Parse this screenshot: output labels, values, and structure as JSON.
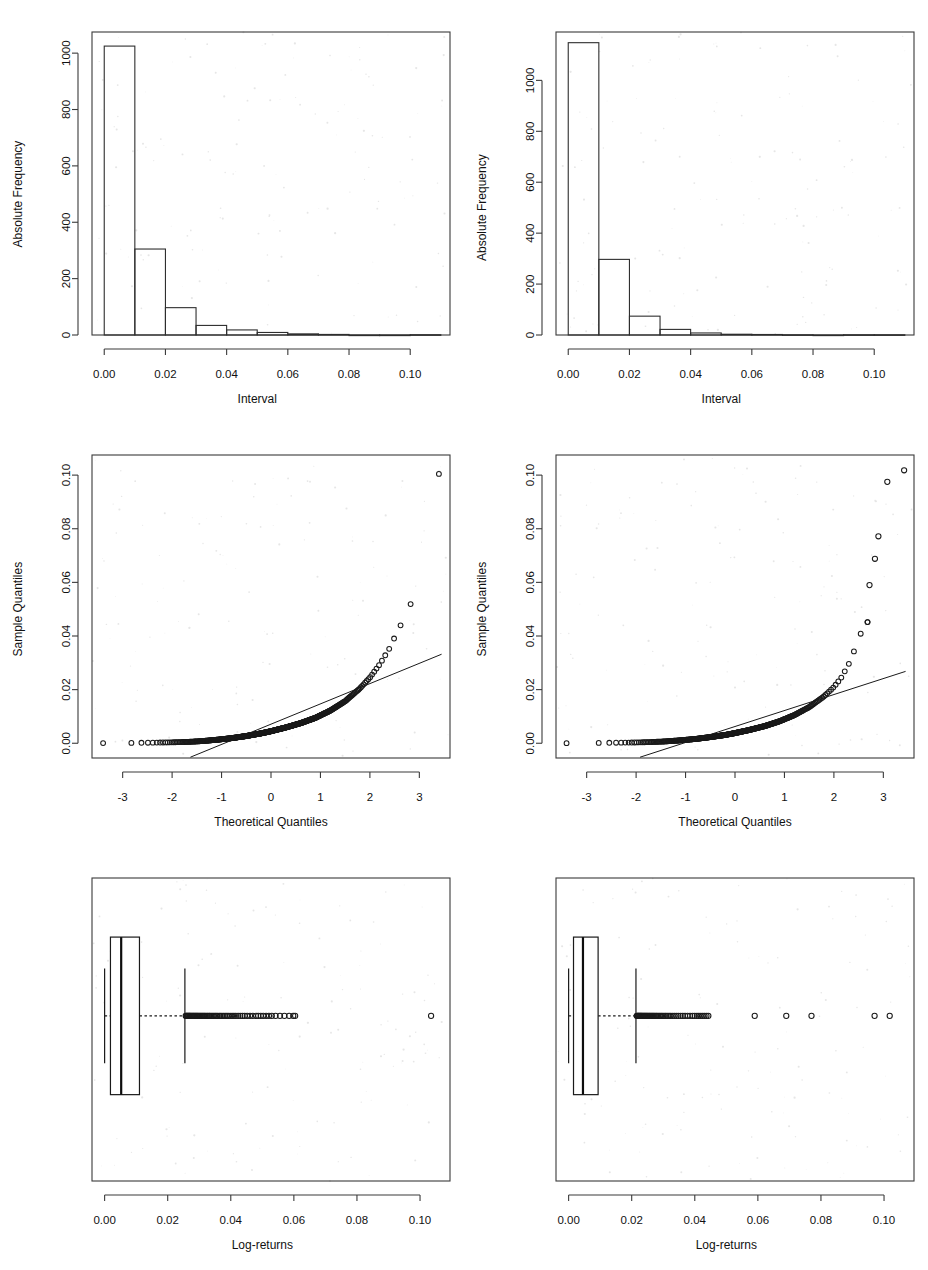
{
  "figure": {
    "width": 928,
    "height": 1270,
    "background": "#ffffff",
    "layout": "2 columns x 3 rows of R base-graphics panels",
    "ink_color": "#1a1a1a"
  },
  "chart_data": [
    {
      "id": "hist-left",
      "type": "bar",
      "subtype": "histogram",
      "title": "",
      "xlabel": "Interval",
      "ylabel": "Absolute Frequency",
      "xlim": [
        -0.004,
        0.113
      ],
      "ylim": [
        0,
        1075
      ],
      "xticks": [
        0.0,
        0.02,
        0.04,
        0.06,
        0.08,
        0.1
      ],
      "xticklabels": [
        "0.00",
        "0.02",
        "0.04",
        "0.06",
        "0.08",
        "0.10"
      ],
      "yticks": [
        0,
        200,
        400,
        600,
        800,
        1000
      ],
      "yticklabels": [
        "0",
        "200",
        "400",
        "600",
        "800",
        "1000"
      ],
      "grid": false,
      "legend": "none",
      "binwidth": 0.01,
      "bin_edges": [
        0.0,
        0.01,
        0.02,
        0.03,
        0.04,
        0.05,
        0.06,
        0.07,
        0.08,
        0.09,
        0.1,
        0.11
      ],
      "categories": [
        "0.00-0.01",
        "0.01-0.02",
        "0.02-0.03",
        "0.03-0.04",
        "0.04-0.05",
        "0.05-0.06",
        "0.06-0.07",
        "0.07-0.08",
        "0.08-0.09",
        "0.09-0.10",
        "0.10-0.11"
      ],
      "values": [
        1025,
        305,
        97,
        34,
        18,
        9,
        4,
        2,
        0,
        0,
        1
      ]
    },
    {
      "id": "hist-right",
      "type": "bar",
      "subtype": "histogram",
      "title": "",
      "xlabel": "Interval",
      "ylabel": "Absolute Frequency",
      "xlim": [
        -0.004,
        0.113
      ],
      "ylim": [
        0,
        1190
      ],
      "xticks": [
        0.0,
        0.02,
        0.04,
        0.06,
        0.08,
        0.1
      ],
      "xticklabels": [
        "0.00",
        "0.02",
        "0.04",
        "0.06",
        "0.08",
        "0.10"
      ],
      "yticks": [
        0,
        200,
        400,
        600,
        800,
        1000
      ],
      "yticklabels": [
        "0",
        "200",
        "400",
        "600",
        "800",
        "1000"
      ],
      "grid": false,
      "legend": "none",
      "binwidth": 0.01,
      "bin_edges": [
        0.0,
        0.01,
        0.02,
        0.03,
        0.04,
        0.05,
        0.06,
        0.07,
        0.08,
        0.09,
        0.1,
        0.11
      ],
      "categories": [
        "0.00-0.01",
        "0.01-0.02",
        "0.02-0.03",
        "0.03-0.04",
        "0.04-0.05",
        "0.05-0.06",
        "0.06-0.07",
        "0.07-0.08",
        "0.08-0.09",
        "0.09-0.10",
        "0.10-0.11"
      ],
      "values": [
        1148,
        297,
        74,
        22,
        8,
        3,
        2,
        1,
        0,
        1,
        1
      ]
    },
    {
      "id": "qq-left",
      "type": "scatter",
      "subtype": "normal-qq-plot",
      "title": "",
      "xlabel": "Theoretical Quantiles",
      "ylabel": "Sample Quantiles",
      "xlim": [
        -3.62,
        3.62
      ],
      "ylim": [
        -0.0055,
        0.1075
      ],
      "xticks": [
        -3,
        -2,
        -1,
        0,
        1,
        2,
        3
      ],
      "xticklabels": [
        "-3",
        "-2",
        "-1",
        "0",
        "1",
        "2",
        "3"
      ],
      "yticks": [
        0.0,
        0.02,
        0.04,
        0.06,
        0.08,
        0.1
      ],
      "yticklabels": [
        "0.00",
        "0.02",
        "0.04",
        "0.06",
        "0.08",
        "0.10"
      ],
      "grid": false,
      "legend": "none",
      "reference_line": {
        "x": [
          -1.63,
          3.45
        ],
        "y": [
          -0.0052,
          0.0332
        ],
        "slope": 0.00756,
        "intercept": 0.00713
      },
      "n_points": 1495,
      "quantile_curve": [
        {
          "x": -3.45,
          "y": 5e-05
        },
        {
          "x": -3.05,
          "y": 8e-05
        },
        {
          "x": -2.85,
          "y": 0.00012
        },
        {
          "x": -2.6,
          "y": 0.00018
        },
        {
          "x": -2.3,
          "y": 0.00025
        },
        {
          "x": -2.0,
          "y": 0.00035
        },
        {
          "x": -1.7,
          "y": 0.0005
        },
        {
          "x": -1.4,
          "y": 0.0008
        },
        {
          "x": -1.1,
          "y": 0.0013
        },
        {
          "x": -0.8,
          "y": 0.0019
        },
        {
          "x": -0.5,
          "y": 0.0027
        },
        {
          "x": -0.2,
          "y": 0.0037
        },
        {
          "x": 0.0,
          "y": 0.0045
        },
        {
          "x": 0.3,
          "y": 0.0059
        },
        {
          "x": 0.6,
          "y": 0.0075
        },
        {
          "x": 0.9,
          "y": 0.0095
        },
        {
          "x": 1.2,
          "y": 0.0122
        },
        {
          "x": 1.5,
          "y": 0.0157
        },
        {
          "x": 1.8,
          "y": 0.0205
        },
        {
          "x": 2.0,
          "y": 0.0245
        },
        {
          "x": 2.2,
          "y": 0.0295
        },
        {
          "x": 2.4,
          "y": 0.0355
        },
        {
          "x": 2.55,
          "y": 0.0415
        },
        {
          "x": 2.7,
          "y": 0.0468
        },
        {
          "x": 2.85,
          "y": 0.053
        },
        {
          "x": 2.95,
          "y": 0.0575
        },
        {
          "x": 3.05,
          "y": 0.06
        },
        {
          "x": 3.15,
          "y": 0.062
        },
        {
          "x": 3.42,
          "y": 0.1043
        }
      ]
    },
    {
      "id": "qq-right",
      "type": "scatter",
      "subtype": "normal-qq-plot",
      "title": "",
      "xlabel": "Theoretical Quantiles",
      "ylabel": "Sample Quantiles",
      "xlim": [
        -3.62,
        3.62
      ],
      "ylim": [
        -0.0055,
        0.1075
      ],
      "xticks": [
        -3,
        -2,
        -1,
        0,
        1,
        2,
        3
      ],
      "xticklabels": [
        "-3",
        "-2",
        "-1",
        "0",
        "1",
        "2",
        "3"
      ],
      "yticks": [
        0.0,
        0.02,
        0.04,
        0.06,
        0.08,
        0.1
      ],
      "yticklabels": [
        "0.00",
        "0.02",
        "0.04",
        "0.06",
        "0.08",
        "0.10"
      ],
      "grid": false,
      "legend": "none",
      "reference_line": {
        "x": [
          -1.92,
          3.45
        ],
        "y": [
          -0.0052,
          0.0268
        ],
        "slope": 0.00596,
        "intercept": 0.00625
      },
      "n_points": 1557,
      "quantile_curve": [
        {
          "x": -3.45,
          "y": 4e-05
        },
        {
          "x": -3.05,
          "y": 7e-05
        },
        {
          "x": -2.9,
          "y": 0.0001
        },
        {
          "x": -2.6,
          "y": 0.00016
        },
        {
          "x": -2.3,
          "y": 0.00022
        },
        {
          "x": -2.0,
          "y": 0.0003
        },
        {
          "x": -1.7,
          "y": 0.00045
        },
        {
          "x": -1.4,
          "y": 0.0007
        },
        {
          "x": -1.1,
          "y": 0.0011
        },
        {
          "x": -0.8,
          "y": 0.0016
        },
        {
          "x": -0.5,
          "y": 0.0023
        },
        {
          "x": -0.2,
          "y": 0.0031
        },
        {
          "x": 0.0,
          "y": 0.0038
        },
        {
          "x": 0.3,
          "y": 0.005
        },
        {
          "x": 0.6,
          "y": 0.0064
        },
        {
          "x": 0.9,
          "y": 0.0082
        },
        {
          "x": 1.2,
          "y": 0.0105
        },
        {
          "x": 1.5,
          "y": 0.0135
        },
        {
          "x": 1.8,
          "y": 0.0175
        },
        {
          "x": 2.0,
          "y": 0.021
        },
        {
          "x": 2.15,
          "y": 0.0245
        },
        {
          "x": 2.3,
          "y": 0.0295
        },
        {
          "x": 2.4,
          "y": 0.034
        },
        {
          "x": 2.5,
          "y": 0.039
        },
        {
          "x": 2.58,
          "y": 0.0425
        },
        {
          "x": 2.68,
          "y": 0.0452
        }
      ],
      "extreme_points": [
        {
          "x": 2.72,
          "y": 0.059
        },
        {
          "x": 2.83,
          "y": 0.0688
        },
        {
          "x": 2.9,
          "y": 0.0772
        },
        {
          "x": 3.08,
          "y": 0.0975
        },
        {
          "x": 3.42,
          "y": 0.1018
        }
      ]
    },
    {
      "id": "box-left",
      "type": "boxplot",
      "orientation": "horizontal",
      "title": "",
      "xlabel": "Log-returns",
      "ylabel": "",
      "xlim": [
        -0.004,
        0.1095
      ],
      "xticks": [
        0.0,
        0.02,
        0.04,
        0.06,
        0.08,
        0.1
      ],
      "xticklabels": [
        "0.00",
        "0.02",
        "0.04",
        "0.06",
        "0.08",
        "0.10"
      ],
      "grid": false,
      "legend": "none",
      "stats": {
        "lower_whisker": 0.0,
        "q1": 0.00185,
        "median": 0.00525,
        "q3": 0.01105,
        "upper_whisker": 0.02545
      },
      "outliers": [
        0.0257,
        0.0259,
        0.0261,
        0.0263,
        0.0265,
        0.0267,
        0.0269,
        0.0271,
        0.0273,
        0.0276,
        0.0278,
        0.0281,
        0.0283,
        0.0286,
        0.0288,
        0.0291,
        0.0293,
        0.0296,
        0.0299,
        0.0302,
        0.0305,
        0.0308,
        0.0311,
        0.0314,
        0.0317,
        0.032,
        0.0324,
        0.0327,
        0.0331,
        0.0334,
        0.0338,
        0.0342,
        0.0346,
        0.035,
        0.0354,
        0.0358,
        0.0363,
        0.0367,
        0.0372,
        0.0377,
        0.0382,
        0.0387,
        0.0392,
        0.0398,
        0.0404,
        0.041,
        0.0416,
        0.0423,
        0.043,
        0.0437,
        0.0444,
        0.0452,
        0.0461,
        0.047,
        0.048,
        0.0487,
        0.0495,
        0.0503,
        0.0512,
        0.0521,
        0.053,
        0.0542,
        0.0556,
        0.057,
        0.0585,
        0.0598,
        0.0604,
        0.1035
      ]
    },
    {
      "id": "box-right",
      "type": "boxplot",
      "orientation": "horizontal",
      "title": "",
      "xlabel": "Log-returns",
      "ylabel": "",
      "xlim": [
        -0.004,
        0.1095
      ],
      "xticks": [
        0.0,
        0.02,
        0.04,
        0.06,
        0.08,
        0.1
      ],
      "xticklabels": [
        "0.00",
        "0.02",
        "0.04",
        "0.06",
        "0.08",
        "0.10"
      ],
      "grid": false,
      "legend": "none",
      "stats": {
        "lower_whisker": 0.0,
        "q1": 0.00155,
        "median": 0.00455,
        "q3": 0.00935,
        "upper_whisker": 0.02135
      },
      "outliers": [
        0.0216,
        0.0218,
        0.022,
        0.0222,
        0.0224,
        0.0226,
        0.0228,
        0.023,
        0.0232,
        0.0234,
        0.0237,
        0.0239,
        0.0242,
        0.0244,
        0.0247,
        0.0249,
        0.0252,
        0.0255,
        0.0258,
        0.0261,
        0.0264,
        0.0267,
        0.027,
        0.0273,
        0.0277,
        0.028,
        0.0284,
        0.0288,
        0.0292,
        0.0296,
        0.03,
        0.0305,
        0.0309,
        0.0314,
        0.0319,
        0.0324,
        0.033,
        0.0336,
        0.0342,
        0.0348,
        0.0355,
        0.0362,
        0.0369,
        0.0377,
        0.0385,
        0.0393,
        0.04,
        0.0407,
        0.0413,
        0.0419,
        0.0425,
        0.0431,
        0.0437,
        0.0443,
        0.059,
        0.069,
        0.077,
        0.097,
        0.1018
      ]
    }
  ]
}
